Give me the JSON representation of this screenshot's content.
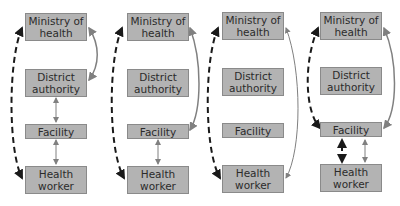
{
  "panels": [
    {
      "boxes": {
        "ministry": "Ministry of health",
        "district": "District authority",
        "facility": "Facility",
        "worker": "Health worker"
      }
    },
    {
      "boxes": {
        "ministry": "Ministry of health",
        "district": "District authority",
        "facility": "Facility",
        "worker": "Health worker"
      }
    },
    {
      "boxes": {
        "ministry": "Ministry of health",
        "district": "District authority",
        "facility": "Facility",
        "worker": "Health worker"
      }
    },
    {
      "boxes": {
        "ministry": "Ministry of health",
        "district": "District authority",
        "facility": "Facility",
        "worker": "Health worker"
      }
    }
  ],
  "colors": {
    "box_fill": "#b3b3b3",
    "box_border": "#8a8a8a",
    "solid_arrow": "#808080",
    "dashed_arrow": "#1a1a1a"
  }
}
